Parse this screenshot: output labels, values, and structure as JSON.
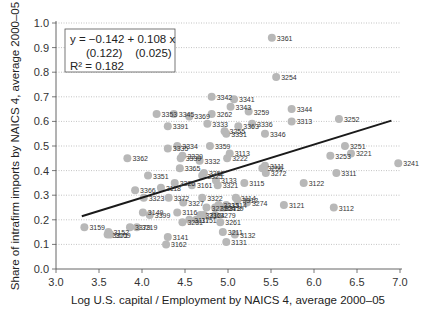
{
  "chart_data": {
    "type": "scatter",
    "title": "",
    "xlabel": "Log U.S. capital / Employment by NAICS 4, average 2000–05",
    "ylabel": "Share of intrafirm imports by NAICS 4, average 2000–05",
    "xlim": [
      3.0,
      7.0
    ],
    "ylim": [
      0.0,
      1.0
    ],
    "xticks": [
      "3.0",
      "3.5",
      "4.0",
      "4.5",
      "5.0",
      "5.5",
      "6.0",
      "6.5",
      "7.0"
    ],
    "yticks": [
      "0.0",
      "0.1",
      "0.2",
      "0.3",
      "0.4",
      "0.5",
      "0.6",
      "0.7",
      "0.8",
      "0.9",
      "1.0"
    ],
    "grid": "horizontal dotted",
    "annotation": {
      "line1": "y = −0.142 + 0.108 x",
      "line2": "(0.122)    (0.025)",
      "line3": "R² = 0.182"
    },
    "regression": {
      "intercept": -0.142,
      "slope": 0.108,
      "se_intercept": 0.122,
      "se_slope": 0.025,
      "r2": 0.182,
      "x_range": [
        3.3,
        6.9
      ]
    },
    "points": [
      {
        "label": "3361",
        "x": 5.51,
        "y": 0.94
      },
      {
        "label": "3254",
        "x": 5.56,
        "y": 0.78
      },
      {
        "label": "3342",
        "x": 4.81,
        "y": 0.7
      },
      {
        "label": "3341",
        "x": 5.07,
        "y": 0.69
      },
      {
        "label": "3343",
        "x": 5.03,
        "y": 0.66
      },
      {
        "label": "3262",
        "x": 4.81,
        "y": 0.63
      },
      {
        "label": "3259",
        "x": 5.24,
        "y": 0.64
      },
      {
        "label": "3369",
        "x": 4.55,
        "y": 0.62
      },
      {
        "label": "3345",
        "x": 4.37,
        "y": 0.63
      },
      {
        "label": "3353",
        "x": 4.17,
        "y": 0.63
      },
      {
        "label": "3391",
        "x": 4.3,
        "y": 0.58
      },
      {
        "label": "3344",
        "x": 5.74,
        "y": 0.65
      },
      {
        "label": "3313",
        "x": 5.74,
        "y": 0.6
      },
      {
        "label": "3252",
        "x": 6.29,
        "y": 0.61
      },
      {
        "label": "3333",
        "x": 4.76,
        "y": 0.59
      },
      {
        "label": "3363",
        "x": 5.12,
        "y": 0.58
      },
      {
        "label": "3336",
        "x": 5.28,
        "y": 0.59
      },
      {
        "label": "3255",
        "x": 4.96,
        "y": 0.56
      },
      {
        "label": "3331",
        "x": 4.98,
        "y": 0.55
      },
      {
        "label": "3346",
        "x": 5.43,
        "y": 0.55
      },
      {
        "label": "3335",
        "x": 4.3,
        "y": 0.49
      },
      {
        "label": "3334",
        "x": 4.41,
        "y": 0.5
      },
      {
        "label": "3359",
        "x": 4.79,
        "y": 0.5
      },
      {
        "label": "3222",
        "x": 4.99,
        "y": 0.45
      },
      {
        "label": "3113",
        "x": 5.02,
        "y": 0.47
      },
      {
        "label": "3362",
        "x": 3.83,
        "y": 0.45
      },
      {
        "label": "3339",
        "x": 4.45,
        "y": 0.45
      },
      {
        "label": "3329",
        "x": 4.47,
        "y": 0.46
      },
      {
        "label": "3332",
        "x": 4.67,
        "y": 0.44
      },
      {
        "label": "3365",
        "x": 4.44,
        "y": 0.41
      },
      {
        "label": "3352",
        "x": 4.72,
        "y": 0.39
      },
      {
        "label": "3325",
        "x": 4.7,
        "y": 0.38
      },
      {
        "label": "3251",
        "x": 6.36,
        "y": 0.5
      },
      {
        "label": "3221",
        "x": 6.43,
        "y": 0.47
      },
      {
        "label": "3253",
        "x": 6.19,
        "y": 0.46
      },
      {
        "label": "3241",
        "x": 6.98,
        "y": 0.43
      },
      {
        "label": "3311",
        "x": 6.26,
        "y": 0.39
      },
      {
        "label": "3256",
        "x": 5.4,
        "y": 0.41
      },
      {
        "label": "3111",
        "x": 5.43,
        "y": 0.42
      },
      {
        "label": "3272",
        "x": 5.44,
        "y": 0.39
      },
      {
        "label": "3122",
        "x": 5.88,
        "y": 0.35
      },
      {
        "label": "3351",
        "x": 4.07,
        "y": 0.38
      },
      {
        "label": "3366",
        "x": 3.92,
        "y": 0.32
      },
      {
        "label": "3326",
        "x": 4.38,
        "y": 0.35
      },
      {
        "label": "3161",
        "x": 4.58,
        "y": 0.34
      },
      {
        "label": "3118",
        "x": 4.22,
        "y": 0.33
      },
      {
        "label": "3133",
        "x": 4.86,
        "y": 0.36
      },
      {
        "label": "3321",
        "x": 4.88,
        "y": 0.34
      },
      {
        "label": "3115",
        "x": 5.19,
        "y": 0.35
      },
      {
        "label": "3322",
        "x": 4.7,
        "y": 0.29
      },
      {
        "label": "3114",
        "x": 5.09,
        "y": 0.29
      },
      {
        "label": "3312",
        "x": 5.11,
        "y": 0.28
      },
      {
        "label": "3274",
        "x": 5.22,
        "y": 0.27
      },
      {
        "label": "3121",
        "x": 5.65,
        "y": 0.26
      },
      {
        "label": "3112",
        "x": 6.23,
        "y": 0.25
      },
      {
        "label": "3323",
        "x": 4.02,
        "y": 0.29
      },
      {
        "label": "3372",
        "x": 4.31,
        "y": 0.29
      },
      {
        "label": "3327",
        "x": 4.48,
        "y": 0.27
      },
      {
        "label": "3399",
        "x": 4.09,
        "y": 0.22
      },
      {
        "label": "3149",
        "x": 4.01,
        "y": 0.23
      },
      {
        "label": "3116",
        "x": 4.41,
        "y": 0.23
      },
      {
        "label": "3271",
        "x": 4.75,
        "y": 0.25
      },
      {
        "label": "3314",
        "x": 4.98,
        "y": 0.26
      },
      {
        "label": "3119",
        "x": 4.95,
        "y": 0.25
      },
      {
        "label": "3273",
        "x": 4.91,
        "y": 0.25
      },
      {
        "label": "3324",
        "x": 4.85,
        "y": 0.25
      },
      {
        "label": "3315",
        "x": 4.89,
        "y": 0.26
      },
      {
        "label": "3159",
        "x": 3.33,
        "y": 0.17
      },
      {
        "label": "3152",
        "x": 3.61,
        "y": 0.15
      },
      {
        "label": "3371",
        "x": 3.6,
        "y": 0.14
      },
      {
        "label": "3169",
        "x": 3.63,
        "y": 0.14
      },
      {
        "label": "3379",
        "x": 3.86,
        "y": 0.17
      },
      {
        "label": "3219",
        "x": 3.94,
        "y": 0.17
      },
      {
        "label": "3231",
        "x": 4.47,
        "y": 0.19
      },
      {
        "label": "3117",
        "x": 4.55,
        "y": 0.2
      },
      {
        "label": "3151",
        "x": 4.63,
        "y": 0.2
      },
      {
        "label": "3212",
        "x": 4.68,
        "y": 0.22
      },
      {
        "label": "3261",
        "x": 4.91,
        "y": 0.19
      },
      {
        "label": "3211",
        "x": 4.94,
        "y": 0.15
      },
      {
        "label": "3364",
        "x": 4.72,
        "y": 0.22
      },
      {
        "label": "3279",
        "x": 4.85,
        "y": 0.22
      },
      {
        "label": "3132",
        "x": 5.08,
        "y": 0.14
      },
      {
        "label": "3131",
        "x": 4.98,
        "y": 0.11
      },
      {
        "label": "3141",
        "x": 4.3,
        "y": 0.13
      },
      {
        "label": "3162",
        "x": 4.28,
        "y": 0.1
      }
    ]
  }
}
